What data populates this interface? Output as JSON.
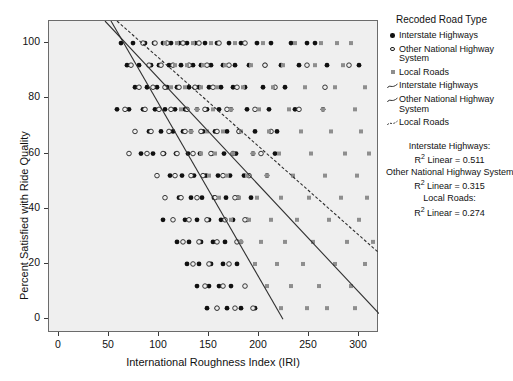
{
  "chart_data": {
    "type": "scatter",
    "title": "",
    "xlabel": "International Roughness Index (IRI)",
    "ylabel": "Percent Satisfied with Ride Quality",
    "xlim": [
      -10,
      320
    ],
    "ylim": [
      -5,
      108
    ],
    "xticks": [
      0,
      50,
      100,
      150,
      200,
      250,
      300
    ],
    "yticks": [
      0,
      20,
      40,
      60,
      80,
      100
    ],
    "grid": false,
    "legend_position": "right",
    "legend_title": "Recoded Road Type",
    "series": [
      {
        "name": "Interstate Highways",
        "marker": "filled-circle",
        "color": "#111111",
        "points": [
          [
            62,
            100
          ],
          [
            74,
            100
          ],
          [
            86,
            100
          ],
          [
            95,
            100
          ],
          [
            104,
            100
          ],
          [
            112,
            100
          ],
          [
            120,
            100
          ],
          [
            128,
            100
          ],
          [
            136,
            100
          ],
          [
            146,
            100
          ],
          [
            158,
            100
          ],
          [
            170,
            100
          ],
          [
            182,
            100
          ],
          [
            198,
            100
          ],
          [
            212,
            100
          ],
          [
            232,
            100
          ],
          [
            248,
            100
          ],
          [
            256,
            100
          ],
          [
            68,
            92
          ],
          [
            80,
            92
          ],
          [
            92,
            92
          ],
          [
            100,
            92
          ],
          [
            110,
            92
          ],
          [
            122,
            92
          ],
          [
            134,
            92
          ],
          [
            142,
            92
          ],
          [
            152,
            92
          ],
          [
            164,
            92
          ],
          [
            176,
            92
          ],
          [
            190,
            92
          ],
          [
            206,
            92
          ],
          [
            222,
            92
          ],
          [
            240,
            92
          ],
          [
            268,
            92
          ],
          [
            300,
            92
          ],
          [
            76,
            84
          ],
          [
            88,
            84
          ],
          [
            98,
            84
          ],
          [
            108,
            84
          ],
          [
            118,
            84
          ],
          [
            130,
            84
          ],
          [
            140,
            84
          ],
          [
            150,
            84
          ],
          [
            162,
            84
          ],
          [
            174,
            84
          ],
          [
            186,
            84
          ],
          [
            204,
            84
          ],
          [
            226,
            84
          ],
          [
            58,
            76
          ],
          [
            70,
            76
          ],
          [
            84,
            76
          ],
          [
            96,
            76
          ],
          [
            106,
            76
          ],
          [
            116,
            76
          ],
          [
            126,
            76
          ],
          [
            138,
            76
          ],
          [
            148,
            76
          ],
          [
            160,
            76
          ],
          [
            172,
            76
          ],
          [
            188,
            76
          ],
          [
            210,
            76
          ],
          [
            236,
            76
          ],
          [
            264,
            76
          ],
          [
            90,
            68
          ],
          [
            102,
            68
          ],
          [
            114,
            68
          ],
          [
            124,
            68
          ],
          [
            132,
            68
          ],
          [
            144,
            68
          ],
          [
            156,
            68
          ],
          [
            168,
            68
          ],
          [
            180,
            68
          ],
          [
            196,
            68
          ],
          [
            218,
            68
          ],
          [
            82,
            60
          ],
          [
            94,
            60
          ],
          [
            105,
            60
          ],
          [
            117,
            60
          ],
          [
            129,
            60
          ],
          [
            141,
            60
          ],
          [
            153,
            60
          ],
          [
            165,
            60
          ],
          [
            177,
            60
          ],
          [
            194,
            60
          ],
          [
            216,
            60
          ],
          [
            111,
            52
          ],
          [
            123,
            52
          ],
          [
            135,
            52
          ],
          [
            147,
            52
          ],
          [
            159,
            52
          ],
          [
            171,
            52
          ],
          [
            185,
            52
          ],
          [
            208,
            52
          ],
          [
            120,
            44
          ],
          [
            132,
            44
          ],
          [
            143,
            44
          ],
          [
            155,
            44
          ],
          [
            167,
            44
          ],
          [
            179,
            44
          ],
          [
            192,
            44
          ],
          [
            104,
            36
          ],
          [
            126,
            36
          ],
          [
            138,
            36
          ],
          [
            150,
            36
          ],
          [
            162,
            36
          ],
          [
            174,
            36
          ],
          [
            188,
            36
          ],
          [
            118,
            28
          ],
          [
            130,
            28
          ],
          [
            142,
            28
          ],
          [
            154,
            28
          ],
          [
            166,
            28
          ],
          [
            182,
            28
          ],
          [
            128,
            20
          ],
          [
            140,
            20
          ],
          [
            152,
            20
          ],
          [
            164,
            20
          ],
          [
            178,
            20
          ],
          [
            138,
            12
          ],
          [
            150,
            12
          ],
          [
            160,
            12
          ],
          [
            172,
            12
          ],
          [
            148,
            4
          ],
          [
            158,
            4
          ],
          [
            168,
            4
          ],
          [
            182,
            4
          ],
          [
            196,
            4
          ]
        ]
      },
      {
        "name": "Other National Highway System",
        "marker": "open-circle",
        "color": "#222222",
        "points": [
          [
            84,
            100
          ],
          [
            96,
            100
          ],
          [
            108,
            100
          ],
          [
            124,
            100
          ],
          [
            140,
            100
          ],
          [
            160,
            100
          ],
          [
            186,
            100
          ],
          [
            72,
            92
          ],
          [
            90,
            92
          ],
          [
            102,
            92
          ],
          [
            114,
            92
          ],
          [
            130,
            92
          ],
          [
            148,
            92
          ],
          [
            170,
            92
          ],
          [
            206,
            92
          ],
          [
            248,
            92
          ],
          [
            290,
            92
          ],
          [
            80,
            84
          ],
          [
            94,
            84
          ],
          [
            106,
            84
          ],
          [
            120,
            84
          ],
          [
            136,
            84
          ],
          [
            154,
            84
          ],
          [
            178,
            84
          ],
          [
            216,
            84
          ],
          [
            266,
            84
          ],
          [
            66,
            76
          ],
          [
            86,
            76
          ],
          [
            100,
            76
          ],
          [
            112,
            76
          ],
          [
            128,
            76
          ],
          [
            146,
            76
          ],
          [
            168,
            76
          ],
          [
            196,
            76
          ],
          [
            240,
            76
          ],
          [
            76,
            68
          ],
          [
            92,
            68
          ],
          [
            110,
            68
          ],
          [
            126,
            68
          ],
          [
            142,
            68
          ],
          [
            158,
            68
          ],
          [
            180,
            68
          ],
          [
            212,
            68
          ],
          [
            70,
            60
          ],
          [
            88,
            60
          ],
          [
            104,
            60
          ],
          [
            118,
            60
          ],
          [
            134,
            60
          ],
          [
            152,
            60
          ],
          [
            174,
            60
          ],
          [
            202,
            60
          ],
          [
            98,
            52
          ],
          [
            116,
            52
          ],
          [
            132,
            52
          ],
          [
            144,
            52
          ],
          [
            164,
            52
          ],
          [
            190,
            52
          ],
          [
            106,
            44
          ],
          [
            122,
            44
          ],
          [
            138,
            44
          ],
          [
            156,
            44
          ],
          [
            176,
            44
          ],
          [
            114,
            36
          ],
          [
            130,
            36
          ],
          [
            148,
            36
          ],
          [
            166,
            36
          ],
          [
            186,
            36
          ],
          [
            124,
            28
          ],
          [
            140,
            28
          ],
          [
            158,
            28
          ],
          [
            178,
            28
          ],
          [
            134,
            20
          ],
          [
            150,
            20
          ],
          [
            170,
            20
          ],
          [
            146,
            12
          ],
          [
            164,
            12
          ],
          [
            186,
            12
          ],
          [
            158,
            4
          ],
          [
            176,
            4
          ],
          [
            194,
            4
          ]
        ]
      },
      {
        "name": "Local Roads",
        "marker": "square",
        "color": "#8e8e8e",
        "points": [
          [
            106,
            100
          ],
          [
            118,
            100
          ],
          [
            134,
            100
          ],
          [
            152,
            100
          ],
          [
            176,
            100
          ],
          [
            204,
            100
          ],
          [
            236,
            100
          ],
          [
            262,
            100
          ],
          [
            278,
            100
          ],
          [
            292,
            100
          ],
          [
            116,
            92
          ],
          [
            128,
            92
          ],
          [
            144,
            92
          ],
          [
            166,
            92
          ],
          [
            192,
            92
          ],
          [
            224,
            92
          ],
          [
            256,
            92
          ],
          [
            284,
            92
          ],
          [
            112,
            84
          ],
          [
            126,
            84
          ],
          [
            142,
            84
          ],
          [
            158,
            84
          ],
          [
            184,
            84
          ],
          [
            214,
            84
          ],
          [
            246,
            84
          ],
          [
            276,
            84
          ],
          [
            306,
            84
          ],
          [
            122,
            76
          ],
          [
            138,
            76
          ],
          [
            154,
            76
          ],
          [
            172,
            76
          ],
          [
            200,
            76
          ],
          [
            230,
            76
          ],
          [
            264,
            76
          ],
          [
            296,
            76
          ],
          [
            132,
            68
          ],
          [
            148,
            68
          ],
          [
            164,
            68
          ],
          [
            182,
            68
          ],
          [
            210,
            68
          ],
          [
            242,
            68
          ],
          [
            272,
            68
          ],
          [
            302,
            68
          ],
          [
            142,
            60
          ],
          [
            156,
            60
          ],
          [
            174,
            60
          ],
          [
            194,
            60
          ],
          [
            220,
            60
          ],
          [
            252,
            60
          ],
          [
            286,
            60
          ],
          [
            310,
            60
          ],
          [
            150,
            52
          ],
          [
            168,
            52
          ],
          [
            188,
            52
          ],
          [
            208,
            52
          ],
          [
            234,
            52
          ],
          [
            266,
            52
          ],
          [
            298,
            52
          ],
          [
            160,
            44
          ],
          [
            180,
            44
          ],
          [
            198,
            44
          ],
          [
            222,
            44
          ],
          [
            250,
            44
          ],
          [
            282,
            44
          ],
          [
            308,
            44
          ],
          [
            172,
            36
          ],
          [
            190,
            36
          ],
          [
            212,
            36
          ],
          [
            238,
            36
          ],
          [
            270,
            36
          ],
          [
            300,
            36
          ],
          [
            182,
            28
          ],
          [
            202,
            28
          ],
          [
            226,
            28
          ],
          [
            254,
            28
          ],
          [
            288,
            28
          ],
          [
            314,
            28
          ],
          [
            196,
            20
          ],
          [
            218,
            20
          ],
          [
            244,
            20
          ],
          [
            276,
            20
          ],
          [
            306,
            20
          ],
          [
            208,
            12
          ],
          [
            232,
            12
          ],
          [
            260,
            12
          ],
          [
            292,
            12
          ],
          [
            222,
            4
          ],
          [
            248,
            4
          ],
          [
            268,
            4
          ],
          [
            296,
            4
          ]
        ]
      }
    ],
    "fit_lines": [
      {
        "name": "Interstate Highways",
        "style": "solid",
        "color": "#2f2f2f",
        "x1": 46,
        "y1": 108,
        "x2": 320,
        "y2": 2,
        "r2": 0.511
      },
      {
        "name": "Other National Highway System",
        "style": "solid",
        "color": "#2f2f2f",
        "x1": 52,
        "y1": 108,
        "x2": 224,
        "y2": 0,
        "r2": 0.315
      },
      {
        "name": "Local Roads",
        "style": "dashed",
        "color": "#2f2f2f",
        "x1": 58,
        "y1": 108,
        "x2": 320,
        "y2": 24,
        "r2": 0.274
      }
    ]
  },
  "legend": {
    "title": "Recoded Road Type",
    "marker_items": [
      {
        "label": "Interstate Highways",
        "key": "filled-circle"
      },
      {
        "label": "Other National Highway\nSystem",
        "key": "open-circle"
      },
      {
        "label": "Local Roads",
        "key": "square"
      }
    ],
    "line_items": [
      {
        "label": "Interstate Highways",
        "key": "line-solid"
      },
      {
        "label": "Other National Highway\nSystem",
        "key": "line-solid"
      },
      {
        "label": "Local Roads",
        "key": "line-dashed"
      }
    ],
    "stats": [
      "Interstate Highways:",
      "R² Linear = 0.511",
      "Other National Highway System:",
      "R² Linear = 0.315",
      "Local Roads:",
      "R² Linear = 0.274"
    ]
  },
  "axes": {
    "x_title": "International Roughness Index (IRI)",
    "y_title": "Percent Satisfied with Ride Quality",
    "x_ticks": [
      "0",
      "50",
      "100",
      "150",
      "200",
      "250",
      "300"
    ],
    "y_ticks": [
      "0",
      "20",
      "40",
      "60",
      "80",
      "100"
    ]
  }
}
